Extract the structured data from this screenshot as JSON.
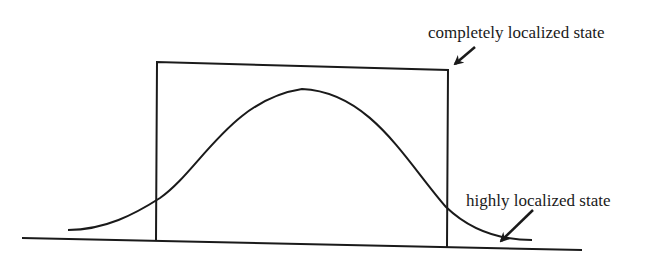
{
  "figure": {
    "annotations": {
      "completely_localized": "completely localized state",
      "highly_localized": "highly localized state"
    },
    "colors": {
      "stroke": "#1a1a1a",
      "background": "#ffffff"
    },
    "elements": {
      "baseline": "horizontal axis line",
      "rectangle": "box-shaped wavefunction (completely localized)",
      "bell_curve": "gaussian-shaped wavefunction (highly localized)"
    }
  }
}
